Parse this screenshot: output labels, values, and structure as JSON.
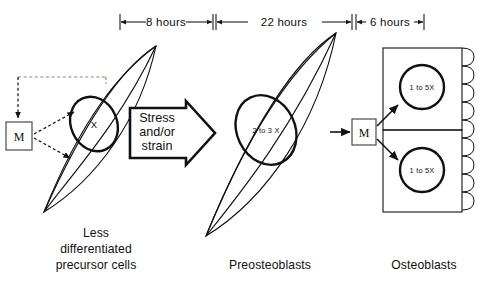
{
  "figure": {
    "title_absent": true,
    "background_color": "#ffffff",
    "ink_color": "#111111",
    "feedback_color": "#7d8f72"
  },
  "timeline": {
    "segments": [
      {
        "label": "8 hours",
        "x_start": 120,
        "x_end": 213,
        "text_x": 166
      },
      {
        "label": "22 hours",
        "x_start": 216,
        "x_end": 352,
        "text_x": 284
      },
      {
        "label": "6 hours",
        "x_start": 356,
        "x_end": 424,
        "text_x": 390
      }
    ],
    "baseline_y": 22
  },
  "stages": [
    {
      "name": "precursor",
      "caption_lines": [
        "Less",
        "differentiated",
        "precursor cells"
      ],
      "caption_x": 96,
      "caption_y": 241,
      "nucleus_label": "X"
    },
    {
      "name": "preosteoblast",
      "caption_lines": [
        "Preosteoblasts"
      ],
      "caption_x": 270,
      "caption_y": 265,
      "nucleus_label": "2 to 3 X"
    },
    {
      "name": "osteoblast",
      "caption_lines": [
        "Osteoblasts"
      ],
      "caption_x": 424,
      "caption_y": 265,
      "nucleus_labels": [
        "1 to 5X",
        "1 to 5X"
      ]
    }
  ],
  "mechanostat": {
    "left_box_label": "M",
    "right_box_label": "M"
  },
  "stimulus": {
    "lines": [
      "Stress",
      "and/or",
      "strain"
    ]
  }
}
